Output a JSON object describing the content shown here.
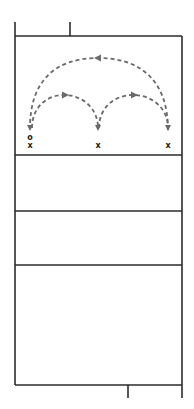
{
  "diagram": {
    "type": "volleyball-court-drill",
    "colors": {
      "court_lines": "#2b2b2b",
      "movement_paths": "#6a6a6a",
      "markers": "#222222",
      "background": "#ffffff"
    },
    "markers": [
      {
        "id": "start",
        "symbol": "o",
        "x": 30,
        "y": 137
      },
      {
        "id": "player-left",
        "symbol": "x",
        "x": 30,
        "y": 146
      },
      {
        "id": "player-middle",
        "symbol": "x",
        "x": 98,
        "y": 146
      },
      {
        "id": "player-right",
        "symbol": "x",
        "x": 168,
        "y": 146
      }
    ],
    "paths": [
      {
        "id": "arc-left-to-middle",
        "from": "player-left",
        "to": "player-middle",
        "style": "dashed",
        "direction": "right"
      },
      {
        "id": "arc-middle-to-right",
        "from": "player-middle",
        "to": "player-right",
        "style": "dashed",
        "direction": "right"
      },
      {
        "id": "arc-right-to-left",
        "from": "player-right",
        "to": "player-left",
        "style": "dashed",
        "direction": "left"
      }
    ],
    "court": {
      "zones": 4,
      "horizontal_lines_y": [
        36,
        155,
        211,
        265,
        385
      ]
    }
  }
}
